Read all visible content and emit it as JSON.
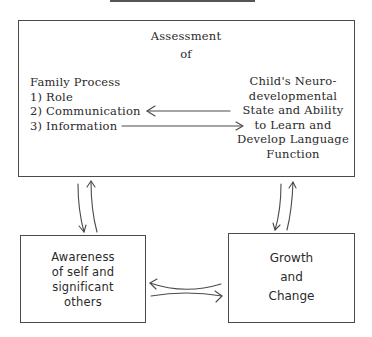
{
  "diagram": {
    "main_box": {
      "title_line1": "Assessment",
      "title_line2": "of",
      "left_block": {
        "heading": "Family Process",
        "items": [
          "1) Role",
          "2) Communication",
          "3) Information"
        ]
      },
      "right_block": {
        "lines": [
          "Child's Neuro-",
          "developmental",
          "State and Ability",
          "to Learn and",
          "Develop Language",
          "Function"
        ]
      }
    },
    "bottom_left_box": {
      "lines": [
        "Awareness",
        "of self and",
        "significant",
        "others"
      ]
    },
    "bottom_right_box": {
      "lines": [
        "Growth",
        "and",
        "Change"
      ]
    },
    "arrows": [
      {
        "from": "Child's Neurodevelopmental State",
        "to": "Communication",
        "direction": "left"
      },
      {
        "from": "Information",
        "to": "to Learn and",
        "direction": "right"
      },
      {
        "from": "Assessment box",
        "to": "Awareness box",
        "direction": "bidirectional"
      },
      {
        "from": "Assessment box",
        "to": "Growth and Change box",
        "direction": "bidirectional"
      },
      {
        "from": "Awareness box",
        "to": "Growth and Change box",
        "direction": "bidirectional"
      }
    ],
    "colors": {
      "line": "#4a4a4a",
      "text": "#2a2a2a",
      "background": "#ffffff"
    }
  }
}
